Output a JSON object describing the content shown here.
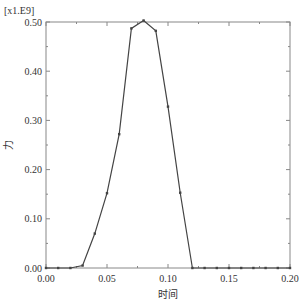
{
  "chart_data": {
    "type": "line",
    "title": "",
    "xlabel": "时间",
    "ylabel": "力",
    "y_multiplier": "[x1.E9]",
    "xlim": [
      0,
      0.2
    ],
    "ylim": [
      0,
      0.5
    ],
    "xticks": [
      0.0,
      0.05,
      0.1,
      0.15,
      0.2
    ],
    "xtick_labels": [
      "0.00",
      "0.05",
      "0.10",
      "0.15",
      "0.20"
    ],
    "yticks": [
      0.0,
      0.1,
      0.2,
      0.3,
      0.4,
      0.5
    ],
    "ytick_labels": [
      "0.00",
      "0.10",
      "0.20",
      "0.30",
      "0.40",
      "0.50"
    ],
    "grid": false,
    "legend": "none",
    "series": [
      {
        "name": "力",
        "color": "#444444",
        "x": [
          0.0,
          0.01,
          0.02,
          0.03,
          0.04,
          0.05,
          0.06,
          0.07,
          0.08,
          0.09,
          0.1,
          0.11,
          0.12,
          0.13,
          0.14,
          0.15,
          0.16,
          0.17,
          0.18,
          0.19,
          0.2
        ],
        "y": [
          0.0,
          0.0,
          0.0,
          0.005,
          0.07,
          0.152,
          0.272,
          0.487,
          0.503,
          0.482,
          0.328,
          0.153,
          0.0,
          0.0,
          0.0,
          0.0,
          0.0,
          0.0,
          0.0,
          0.0,
          0.0
        ]
      }
    ]
  }
}
